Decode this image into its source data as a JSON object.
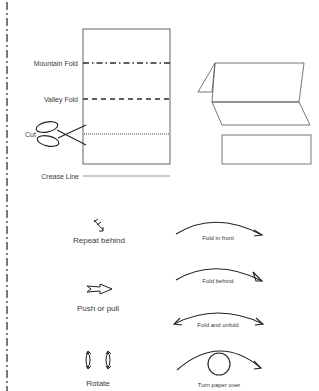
{
  "legend": {
    "line_types": [
      {
        "label": "Mountain Fold",
        "style": "dash-dot"
      },
      {
        "label": "Valley Fold",
        "style": "dashed"
      },
      {
        "label": "Cut",
        "style": "dotted",
        "icon": "scissors-icon"
      },
      {
        "label": "Crease Line",
        "style": "solid-thin"
      }
    ]
  },
  "symbols_left": [
    {
      "label": "Repeat behind",
      "icon": "repeat-behind-arrow-icon"
    },
    {
      "label": "Push or pull",
      "icon": "push-pull-arrow-icon"
    },
    {
      "label": "Rotate",
      "icon": "rotate-arrows-icon"
    }
  ],
  "symbols_right": [
    {
      "label": "Fold in front",
      "icon": "fold-in-front-arrow-icon"
    },
    {
      "label": "Fold behind",
      "icon": "fold-behind-arrow-icon"
    },
    {
      "label": "Fold and unfold",
      "icon": "fold-unfold-arrow-icon"
    },
    {
      "label": "Turn paper over",
      "icon": "turn-over-arrow-icon"
    }
  ],
  "colors": {
    "line": "#2b2b2b",
    "paper_outline": "#555555",
    "text": "#3a3a3a",
    "background": "#ffffff"
  }
}
